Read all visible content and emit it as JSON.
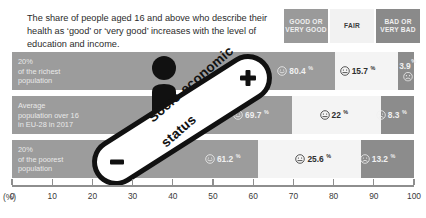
{
  "headline": "The share of people aged 16 and above who describe their health as ‘good’ or ‘very good’ increases with the level of education and income.",
  "legend": {
    "good": "GOOD OR VERY GOOD",
    "fair": "FAIR",
    "bad": "BAD OR VERY BAD",
    "colors": {
      "good": "#9a9a9a",
      "fair": "#f2f2f2",
      "bad": "#8a8a8a"
    }
  },
  "axis": {
    "unit": "(%)",
    "ticks": [
      "0",
      "10",
      "20",
      "30",
      "40",
      "50",
      "60",
      "70",
      "80",
      "90",
      "100"
    ]
  },
  "slider": {
    "label_line1": "Socio-economic",
    "label_line2": "status",
    "minus": "–",
    "plus": "+"
  },
  "rows": [
    {
      "label": "20%\nof the richest\npopulation",
      "label_l1": "20%",
      "label_l2": "of the richest",
      "label_l3": "population",
      "good": "80.4",
      "fair": "15.7",
      "bad": "3.9",
      "pct": "%"
    },
    {
      "label": "Average\npopulation over 16\nin EU-28 in 2017",
      "label_l1": "Average",
      "label_l2": "population over 16",
      "label_l3": "in EU-28 in 2017",
      "good": "69.7",
      "fair": "22",
      "bad": "8.3",
      "pct": "%"
    },
    {
      "label": "20%\nof the poorest\npopulation",
      "label_l1": "20%",
      "label_l2": "of the poorest",
      "label_l3": "population",
      "good": "61.2",
      "fair": "25.6",
      "bad": "13.2",
      "pct": "%"
    }
  ],
  "chart_data": {
    "type": "bar",
    "orientation": "horizontal",
    "stacked": true,
    "title": "The share of people aged 16 and above who describe their health as ‘good’ or ‘very good’ increases with the level of education and income.",
    "xlabel": "(%)",
    "ylabel": "",
    "xlim": [
      0,
      100
    ],
    "xticks": [
      0,
      10,
      20,
      30,
      40,
      50,
      60,
      70,
      80,
      90,
      100
    ],
    "grid": false,
    "legend_position": "top-right",
    "categories": [
      "20% of the richest population",
      "Average population over 16 in EU-28 in 2017",
      "20% of the poorest population"
    ],
    "series": [
      {
        "name": "GOOD OR VERY GOOD",
        "values": [
          80.4,
          69.7,
          61.2
        ],
        "color": "#9c9c9c"
      },
      {
        "name": "FAIR",
        "values": [
          15.7,
          22,
          8.3
        ],
        "color": "#f4f4f4"
      },
      {
        "name": "BAD OR VERY BAD",
        "values": [
          3.9,
          8.3,
          13.2
        ],
        "color": "#8c8c8c"
      }
    ],
    "annotations": [
      "Socio-economic status",
      "–",
      "+"
    ]
  }
}
